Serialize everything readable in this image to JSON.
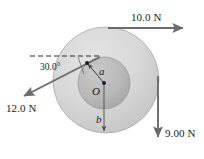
{
  "figure": {
    "background_color": "#ffffff"
  },
  "body": {
    "outer_disk": {
      "name": "outer-disk",
      "fill_color": "#d6d6d6",
      "edge_color": "#9a9a9a",
      "center_x": 106,
      "center_y": 80,
      "radius": 53
    },
    "inner_disk": {
      "name": "inner-disk",
      "fill_color": "#b9b9b9",
      "edge_color": "#8e8e8e",
      "center_x": 104,
      "center_y": 83,
      "radius": 26
    }
  },
  "center_point": {
    "label": "O",
    "x": 104,
    "y": 83
  },
  "radii": [
    {
      "label": "a",
      "name": "inner-radius",
      "description": "inner radius from center O to inner disk edge"
    },
    {
      "label": "b",
      "name": "outer-radius",
      "description": "outer radius from center O to outer disk edge"
    }
  ],
  "angle": {
    "label": "30.0°",
    "value": 30.0,
    "units": "degrees",
    "measured_from": "horizontal dashed reference line"
  },
  "forces": [
    {
      "name": "force-top",
      "label": "10.0 N",
      "magnitude": 10.0,
      "units": "N",
      "direction": "right",
      "direction_degrees": 0,
      "applied_at": "top of outer disk"
    },
    {
      "name": "force-left",
      "label": "12.0 N",
      "magnitude": 12.0,
      "units": "N",
      "direction": "down-left",
      "direction_degrees": 210,
      "applied_at": "inner disk edge at 30.0 degrees above horizontal"
    },
    {
      "name": "force-right",
      "label": "9.00 N",
      "magnitude": 9.0,
      "units": "N",
      "direction": "down",
      "direction_degrees": 270,
      "applied_at": "right side of outer disk"
    }
  ],
  "style": {
    "arrow_color": "#6b6b6b",
    "dashed_line_color": "#2a2a2a",
    "leader_line_color": "#4a4a4a",
    "text_color": "#1b1b1b"
  }
}
